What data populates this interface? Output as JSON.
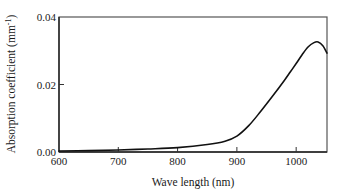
{
  "chart_data": {
    "type": "line",
    "title": "",
    "xlabel": "Wave length (nm)",
    "ylabel": "Absorption coefficient (mm",
    "ylabel_superscript": "-1",
    "ylabel_suffix": ")",
    "xlim": [
      600,
      1052
    ],
    "ylim": [
      0,
      0.04
    ],
    "x_ticks": [
      600,
      700,
      800,
      900,
      1000
    ],
    "x_tick_labels": [
      "600",
      "700",
      "800",
      "900",
      "1000"
    ],
    "y_ticks": [
      0.0,
      0.02,
      0.04
    ],
    "y_tick_labels": [
      "0.00",
      "0.02",
      "0.04"
    ],
    "grid": false,
    "legend": null,
    "series": [
      {
        "name": "Absorption coefficient",
        "color": "#111111",
        "x": [
          600,
          650,
          700,
          750,
          800,
          850,
          880,
          900,
          920,
          940,
          960,
          980,
          990,
          1000,
          1010,
          1020,
          1030,
          1037,
          1045,
          1052
        ],
        "y": [
          0.0003,
          0.0004,
          0.0006,
          0.0009,
          0.0013,
          0.0022,
          0.0032,
          0.0047,
          0.0078,
          0.012,
          0.0165,
          0.0212,
          0.0237,
          0.0262,
          0.0288,
          0.0311,
          0.0324,
          0.0326,
          0.0315,
          0.0293
        ]
      }
    ]
  }
}
